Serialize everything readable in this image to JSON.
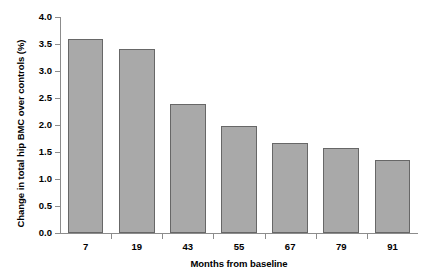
{
  "chart_data": {
    "type": "bar",
    "title": "",
    "subtitle": "",
    "xlabel": "Months from baseline",
    "ylabel": "Change in total hip BMC over controls (%)",
    "categories": [
      "7",
      "19",
      "43",
      "55",
      "67",
      "79",
      "91"
    ],
    "values": [
      3.6,
      3.4,
      2.38,
      1.98,
      1.67,
      1.57,
      1.36
    ],
    "ylim": [
      0.0,
      4.0
    ],
    "ytick_values": [
      0.0,
      0.5,
      1.0,
      1.5,
      2.0,
      2.5,
      3.0,
      3.5,
      4.0
    ],
    "ytick_labels": [
      "0.0",
      "0.5",
      "1.0",
      "1.5",
      "2.0",
      "2.5",
      "3.0",
      "3.5",
      "4.0"
    ],
    "grid": false,
    "legend": null,
    "legend_position": "none",
    "bar_fill_color": "#a9a9a9",
    "bar_border_color": "#676767",
    "axis_color": "#8c8c8c",
    "background_color": "#ffffff",
    "annotations": []
  },
  "artifacts": {
    "top_clipped_text": ""
  }
}
